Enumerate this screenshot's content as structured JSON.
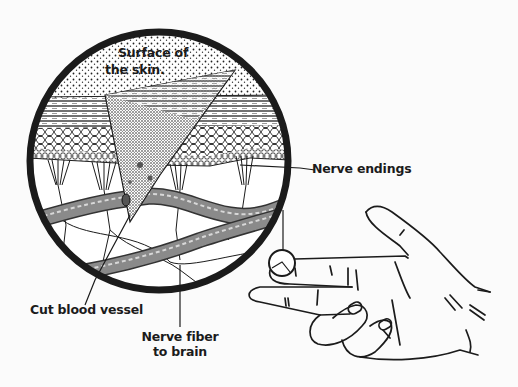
{
  "diagram": {
    "labels": {
      "surface_line1": "Surface of",
      "surface_line2": "the skin.",
      "nerve_endings": "Nerve endings",
      "cut_blood_vessel": "Cut blood vessel",
      "nerve_fiber_line1": "Nerve fiber",
      "nerve_fiber_line2": "to brain"
    },
    "colors": {
      "background": "#fbfbfb",
      "ink": "#1b1b1b",
      "vessel_fill": "#8a8a8a",
      "vessel_highlight": "#d8d8d8",
      "skin_fill": "#ffffff"
    },
    "magnifier": {
      "cx": 159,
      "cy": 161,
      "r": 131
    },
    "finger_marker": {
      "cx": 282,
      "cy": 263,
      "r": 13
    }
  }
}
